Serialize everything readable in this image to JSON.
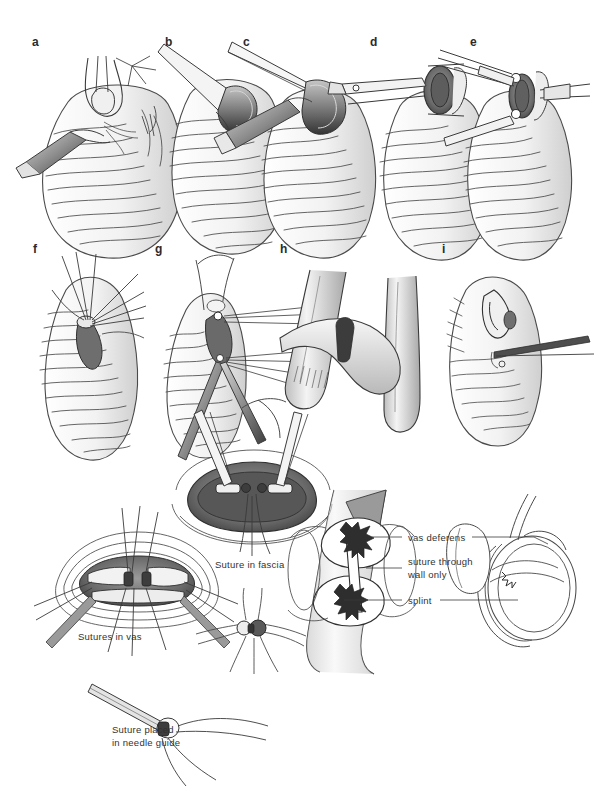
{
  "figure": {
    "kind": "medical-line-illustration",
    "background_color": "#ffffff",
    "ink_color": "#3a3a3a",
    "shade_color": "#8c8c8c",
    "dark_shade_color": "#4a4a4a",
    "width": 597,
    "height": 800
  },
  "panels": {
    "row1": [
      {
        "letter": "a",
        "x": 32,
        "y": 36
      },
      {
        "letter": "b",
        "x": 165,
        "y": 36
      },
      {
        "letter": "c",
        "x": 243,
        "y": 36
      },
      {
        "letter": "d",
        "x": 370,
        "y": 36
      },
      {
        "letter": "e",
        "x": 470,
        "y": 36
      }
    ],
    "row2": [
      {
        "letter": "f",
        "x": 33,
        "y": 243
      },
      {
        "letter": "g",
        "x": 155,
        "y": 243
      },
      {
        "letter": "h",
        "x": 280,
        "y": 243
      },
      {
        "letter": "i",
        "x": 442,
        "y": 243
      }
    ]
  },
  "captions": [
    {
      "id": "sutures-in-vas",
      "text": "Sutures in vas",
      "x": 78,
      "y": 630
    },
    {
      "id": "suture-in-fascia",
      "text": "Suture in fascia",
      "x": 215,
      "y": 558
    },
    {
      "id": "suture-placed-in-needle-guide",
      "text": "Suture placed\nin needle guide",
      "x": 112,
      "y": 723
    }
  ],
  "leader_labels": [
    {
      "id": "vas-deferens",
      "text": "vas deferens",
      "x": 408,
      "y": 533
    },
    {
      "id": "suture-through-wall-only",
      "text": "suture through\nwall only",
      "x": 408,
      "y": 556
    },
    {
      "id": "splint",
      "text": "splint",
      "x": 408,
      "y": 596
    }
  ],
  "colors": {
    "ink": "#3a3a3a",
    "light_ink": "#5d5d5d",
    "hair_line": "#6b6b6b",
    "instrument_dark": "#3c3c3c",
    "instrument_mid": "#7b7b7b",
    "instrument_light": "#c9c9c9",
    "tissue_shade": "#bdbdbd",
    "text": "#33322f"
  }
}
